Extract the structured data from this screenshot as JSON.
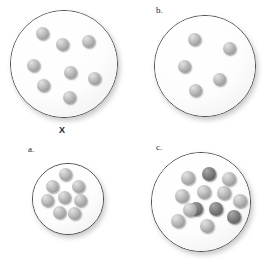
{
  "figure": {
    "background_color": "#ffffff",
    "width": 268,
    "height": 264
  },
  "colors": {
    "sphere_light": "#a8a8a8",
    "sphere_dark": "#6e6e6e",
    "container_outline": "#4a4a4a",
    "container_fill": "#ffffff",
    "label_text": "#1c1c1c"
  },
  "panels": [
    {
      "id": "panel-x",
      "label": "X",
      "label_style": "bold",
      "label_position": "below-center",
      "label_x": 59,
      "label_y": 126,
      "container": {
        "cx": 64,
        "cy": 64,
        "r": 54
      },
      "sphere_radius": 6.5,
      "sphere_count": 8,
      "dark_count": 0,
      "light_count": 8,
      "spheres": [
        {
          "cx": 42,
          "cy": 33,
          "shade": "light"
        },
        {
          "cx": 62,
          "cy": 44,
          "shade": "light"
        },
        {
          "cx": 88,
          "cy": 41,
          "shade": "light"
        },
        {
          "cx": 33,
          "cy": 65,
          "shade": "light"
        },
        {
          "cx": 70,
          "cy": 72,
          "shade": "light"
        },
        {
          "cx": 94,
          "cy": 78,
          "shade": "light"
        },
        {
          "cx": 43,
          "cy": 85,
          "shade": "light"
        },
        {
          "cx": 69,
          "cy": 97,
          "shade": "light"
        }
      ]
    },
    {
      "id": "panel-b",
      "label": "b.",
      "label_style": "normal",
      "label_position": "above-left",
      "label_x": 156,
      "label_y": 6,
      "container": {
        "cx": 205,
        "cy": 66,
        "r": 51
      },
      "sphere_radius": 6.5,
      "sphere_count": 5,
      "dark_count": 0,
      "light_count": 5,
      "spheres": [
        {
          "cx": 194,
          "cy": 39,
          "shade": "light"
        },
        {
          "cx": 229,
          "cy": 48,
          "shade": "light"
        },
        {
          "cx": 184,
          "cy": 66,
          "shade": "light"
        },
        {
          "cx": 219,
          "cy": 79,
          "shade": "light"
        },
        {
          "cx": 195,
          "cy": 90,
          "shade": "light"
        }
      ]
    },
    {
      "id": "panel-a",
      "label": "a.",
      "label_style": "normal",
      "label_position": "above-left",
      "label_x": 28,
      "label_y": 145,
      "container": {
        "cx": 68,
        "cy": 199,
        "r": 36
      },
      "sphere_radius": 6.5,
      "sphere_count": 8,
      "dark_count": 0,
      "light_count": 8,
      "spheres": [
        {
          "cx": 65,
          "cy": 174,
          "shade": "light"
        },
        {
          "cx": 52,
          "cy": 186,
          "shade": "light"
        },
        {
          "cx": 78,
          "cy": 186,
          "shade": "light"
        },
        {
          "cx": 64,
          "cy": 197,
          "shade": "light"
        },
        {
          "cx": 47,
          "cy": 200,
          "shade": "light"
        },
        {
          "cx": 80,
          "cy": 200,
          "shade": "light"
        },
        {
          "cx": 59,
          "cy": 212,
          "shade": "light"
        },
        {
          "cx": 74,
          "cy": 213,
          "shade": "light"
        }
      ]
    },
    {
      "id": "panel-c",
      "label": "c.",
      "label_style": "normal",
      "label_position": "above-left",
      "label_x": 156,
      "label_y": 143,
      "container": {
        "cx": 201,
        "cy": 202,
        "r": 50
      },
      "sphere_radius": 7,
      "sphere_count": 13,
      "dark_count": 4,
      "light_count": 9,
      "spheres": [
        {
          "cx": 188,
          "cy": 178,
          "shade": "light"
        },
        {
          "cx": 209,
          "cy": 174,
          "shade": "dark"
        },
        {
          "cx": 229,
          "cy": 179,
          "shade": "light"
        },
        {
          "cx": 182,
          "cy": 196,
          "shade": "light"
        },
        {
          "cx": 204,
          "cy": 192,
          "shade": "light"
        },
        {
          "cx": 224,
          "cy": 193,
          "shade": "light"
        },
        {
          "cx": 240,
          "cy": 201,
          "shade": "light"
        },
        {
          "cx": 196,
          "cy": 209,
          "shade": "dark"
        },
        {
          "cx": 216,
          "cy": 209,
          "shade": "dark"
        },
        {
          "cx": 234,
          "cy": 217,
          "shade": "dark"
        },
        {
          "cx": 178,
          "cy": 221,
          "shade": "light"
        },
        {
          "cx": 207,
          "cy": 226,
          "shade": "light"
        },
        {
          "cx": 190,
          "cy": 210,
          "shade": "light"
        }
      ]
    }
  ]
}
